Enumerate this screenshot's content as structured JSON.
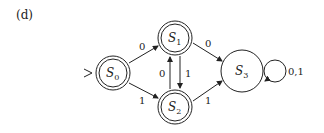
{
  "figure_label": "(d)",
  "states": [
    {
      "id": "S0",
      "name": "S",
      "sub": "0",
      "accepting": true,
      "start": true
    },
    {
      "id": "S1",
      "name": "S",
      "sub": "1",
      "accepting": true,
      "start": false
    },
    {
      "id": "S2",
      "name": "S",
      "sub": "2",
      "accepting": true,
      "start": false
    },
    {
      "id": "S3",
      "name": "S",
      "sub": "3",
      "accepting": false,
      "start": false
    }
  ],
  "transitions": [
    {
      "from": "S0",
      "to": "S1",
      "label": "0"
    },
    {
      "from": "S0",
      "to": "S2",
      "label": "1"
    },
    {
      "from": "S1",
      "to": "S2",
      "label": "1"
    },
    {
      "from": "S2",
      "to": "S1",
      "label": "0"
    },
    {
      "from": "S1",
      "to": "S3",
      "label": "0"
    },
    {
      "from": "S2",
      "to": "S3",
      "label": "1"
    },
    {
      "from": "S3",
      "to": "S3",
      "label": "0,1"
    }
  ],
  "colors": {
    "stroke": "#222222",
    "background": "#ffffff"
  }
}
